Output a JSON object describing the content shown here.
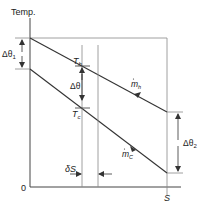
{
  "diagram": {
    "y_axis_label": "Temp.",
    "origin_label": "0",
    "x_axis_end_label": "S",
    "hot_stream": {
      "temp_label": "T",
      "temp_sub": "h",
      "flow_label": "m",
      "flow_sub": "h"
    },
    "cold_stream": {
      "temp_label": "T",
      "temp_sub": "c",
      "flow_label": "m",
      "flow_sub": "C"
    },
    "delta_theta_label": "Δθ",
    "delta_theta1": {
      "label": "Δθ",
      "sub": "1"
    },
    "delta_theta2": {
      "label": "Δθ",
      "sub": "2"
    },
    "delta_s_label": "δS",
    "colors": {
      "line": "#333333",
      "thin_line": "#888888",
      "background": "#ffffff"
    }
  }
}
